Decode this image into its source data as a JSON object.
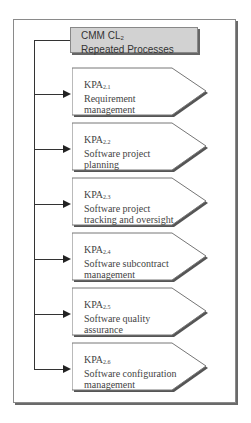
{
  "header": {
    "title_prefix": "CMM CL",
    "title_sub": "2",
    "subtitle": "Repeated Processes"
  },
  "kpas": [
    {
      "prefix": "KPA",
      "sub": "2.1",
      "line1": "Requirement",
      "line2": "management"
    },
    {
      "prefix": "KPA",
      "sub": "2.2",
      "line1": "Software project",
      "line2": "planning"
    },
    {
      "prefix": "KPA",
      "sub": "2.3",
      "line1": "Software project",
      "line2": "tracking and oversight"
    },
    {
      "prefix": "KPA",
      "sub": "2.4",
      "line1": "Software subcontract",
      "line2": "management"
    },
    {
      "prefix": "KPA",
      "sub": "2.5",
      "line1": "Software quality",
      "line2": "assurance"
    },
    {
      "prefix": "KPA",
      "sub": "2.6",
      "line1": "Software configuration",
      "line2": "management"
    }
  ]
}
